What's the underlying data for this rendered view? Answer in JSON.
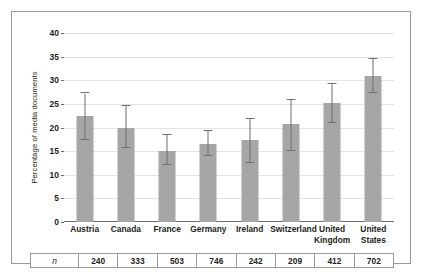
{
  "chart_data": {
    "type": "bar",
    "title": "",
    "xlabel": "",
    "ylabel": "Percentage of media documents",
    "ylim": [
      0,
      40
    ],
    "yticks": [
      0,
      5,
      10,
      15,
      20,
      25,
      30,
      35,
      40
    ],
    "grid": true,
    "legend": "none",
    "error_bars": "95% confidence interval",
    "categories": [
      "Austria",
      "Canada",
      "France",
      "Germany",
      "Ireland",
      "Switzerland",
      "United Kingdom",
      "United States"
    ],
    "values": [
      22.5,
      20.0,
      15.1,
      16.6,
      17.3,
      20.7,
      25.1,
      30.8
    ],
    "err_low": [
      17.3,
      15.7,
      12.0,
      14.0,
      12.4,
      15.1,
      21.0,
      27.2
    ],
    "err_high": [
      27.2,
      24.5,
      18.4,
      19.3,
      21.9,
      25.8,
      29.3,
      34.5
    ],
    "bar_color": "#a6a6a6",
    "error_color": "#6f6f6f",
    "gridline_color": "#e3e3e3"
  },
  "n_table": {
    "header_label": "n",
    "values": [
      "240",
      "333",
      "503",
      "746",
      "242",
      "209",
      "412",
      "702"
    ]
  }
}
